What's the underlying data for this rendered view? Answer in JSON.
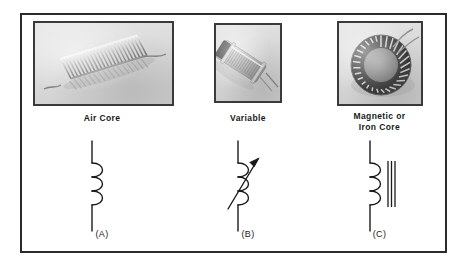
{
  "figure": {
    "title_alt": "Types of inductors",
    "border_color": "#2b2b2b",
    "background_color": "#ffffff",
    "ink_color": "#1a1a1a"
  },
  "panels": [
    {
      "id": "air-core",
      "caption": "Air Core",
      "figure_label": "(A)",
      "photo_alt": "helical air-core coil with two lead wires",
      "symbol": {
        "type": "inductor",
        "loops": 3,
        "has_arrow": false,
        "core_lines": 0
      }
    },
    {
      "id": "variable",
      "caption": "Variable",
      "figure_label": "(B)",
      "photo_alt": "cylindrical slug-tuned variable inductor",
      "symbol": {
        "type": "inductor",
        "loops": 3,
        "has_arrow": true,
        "core_lines": 0
      }
    },
    {
      "id": "magnetic-iron-core",
      "caption": "Magnetic or\nIron Core",
      "figure_label": "(C)",
      "photo_alt": "toroidal iron core inductor wound with wire",
      "symbol": {
        "type": "inductor",
        "loops": 3,
        "has_arrow": false,
        "core_lines": 3
      }
    }
  ]
}
